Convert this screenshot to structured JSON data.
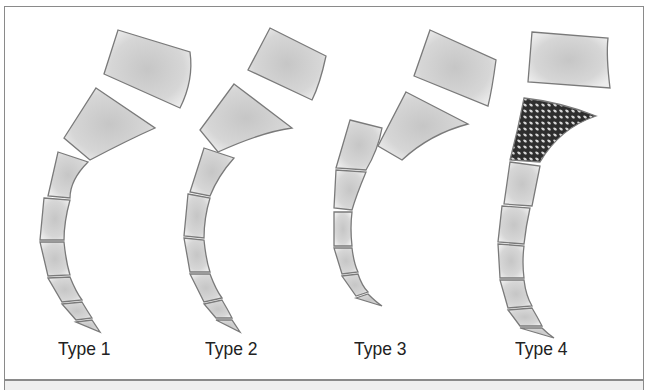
{
  "figure": {
    "panels": [
      {
        "label": "Type 1"
      },
      {
        "label": "Type 2"
      },
      {
        "label": "Type 3"
      },
      {
        "label": "Type 4"
      }
    ]
  },
  "colors": {
    "border": "#8a8a8a",
    "segment_fill": "#dcdcdc",
    "segment_stroke": "#7a7a7a",
    "reticulate_fill": "#3a3a3a",
    "footer_band": "#efefef"
  }
}
